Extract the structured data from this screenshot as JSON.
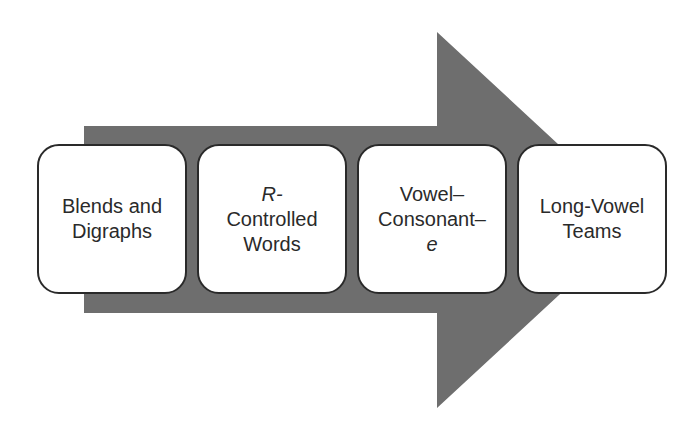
{
  "diagram": {
    "type": "process-arrow",
    "colors": {
      "arrow": "#6e6e6e",
      "box_fill": "#ffffff",
      "box_border": "#2a2a2a",
      "text": "#2a2a2a",
      "background": "#ffffff"
    },
    "steps": [
      {
        "lines": [
          "Blends and",
          "Digraphs"
        ]
      },
      {
        "lines": [
          "R-",
          "Controlled",
          "Words"
        ],
        "italic_line": 0
      },
      {
        "lines": [
          "Vowel–",
          "Consonant–",
          "e"
        ],
        "italic_line": 2
      },
      {
        "lines": [
          "Long-Vowel",
          "Teams"
        ]
      }
    ]
  }
}
